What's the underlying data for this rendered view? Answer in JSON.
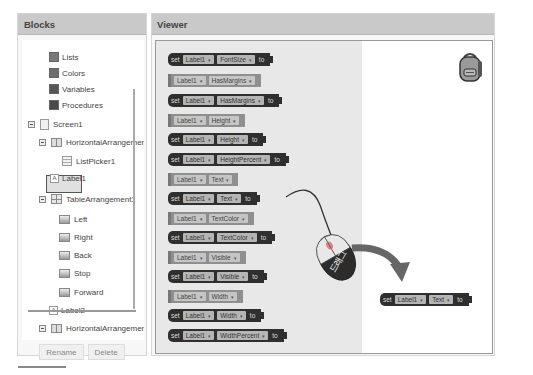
{
  "blocks_panel": {
    "title": "Blocks",
    "builtin_items": [
      {
        "label": "Lists",
        "color": "#7a7a7a"
      },
      {
        "label": "Colors",
        "color": "#6d6d6d"
      },
      {
        "label": "Variables",
        "color": "#555555"
      },
      {
        "label": "Procedures",
        "color": "#4a4a4a"
      }
    ],
    "tree": [
      {
        "label": "Screen1",
        "icon": "screen-icon",
        "level": 0,
        "toggle": true
      },
      {
        "label": "HorizontalArrangement1",
        "icon": "horizontal-arrangement-icon",
        "level": 1,
        "toggle": true
      },
      {
        "label": "ListPicker1",
        "icon": "listpicker-icon",
        "level": 2,
        "toggle": false
      },
      {
        "label": "Label1",
        "icon": "label-icon",
        "level": 2,
        "toggle": false,
        "selected": true
      },
      {
        "label": "TableArrangement1",
        "icon": "table-arrangement-icon",
        "level": 1,
        "toggle": true
      },
      {
        "label": "Left",
        "icon": "button-icon",
        "level": 2,
        "toggle": false
      },
      {
        "label": "Right",
        "icon": "button-icon",
        "level": 2,
        "toggle": false
      },
      {
        "label": "Back",
        "icon": "button-icon",
        "level": 2,
        "toggle": false
      },
      {
        "label": "Stop",
        "icon": "button-icon",
        "level": 2,
        "toggle": false
      },
      {
        "label": "Forward",
        "icon": "button-icon",
        "level": 2,
        "toggle": false
      },
      {
        "label": "Label2",
        "icon": "label-icon",
        "level": 1,
        "toggle": false
      },
      {
        "label": "HorizontalArrangement2",
        "icon": "horizontal-arrangement-icon",
        "level": 1,
        "toggle": true
      },
      {
        "label": "Button1",
        "icon": "button-icon",
        "level": 2,
        "toggle": false
      },
      {
        "label": "Button2",
        "icon": "button-icon",
        "level": 2,
        "toggle": false
      }
    ],
    "rename_label": "Rename",
    "delete_label": "Delete"
  },
  "viewer": {
    "title": "Viewer",
    "set_keyword": "set",
    "to_keyword": "to",
    "component": "Label1",
    "blocks": [
      {
        "type": "setter",
        "property": "FontSize"
      },
      {
        "type": "getter",
        "property": "HasMargins"
      },
      {
        "type": "setter",
        "property": "HasMargins"
      },
      {
        "type": "getter",
        "property": "Height"
      },
      {
        "type": "setter",
        "property": "Height"
      },
      {
        "type": "setter",
        "property": "HeightPercent"
      },
      {
        "type": "getter",
        "property": "Text"
      },
      {
        "type": "setter",
        "property": "Text"
      },
      {
        "type": "getter",
        "property": "TextColor"
      },
      {
        "type": "setter",
        "property": "TextColor"
      },
      {
        "type": "getter",
        "property": "Visible"
      },
      {
        "type": "setter",
        "property": "Visible"
      },
      {
        "type": "getter",
        "property": "Width"
      },
      {
        "type": "setter",
        "property": "Width"
      },
      {
        "type": "setter",
        "property": "WidthPercent"
      }
    ],
    "dropped_block": {
      "type": "setter",
      "property": "Text"
    },
    "drag_label": "드래그"
  }
}
